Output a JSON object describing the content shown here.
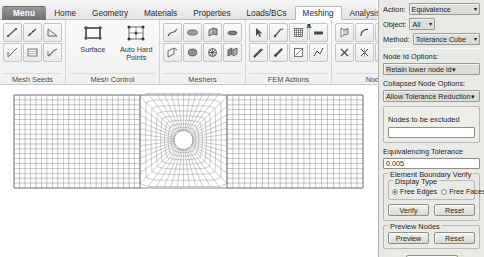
{
  "ribbon": {
    "tabs": [
      {
        "label": "Menu",
        "kind": "menu"
      },
      {
        "label": "Home",
        "kind": "normal"
      },
      {
        "label": "Geometry",
        "kind": "normal"
      },
      {
        "label": "Materials",
        "kind": "normal"
      },
      {
        "label": "Properties",
        "kind": "normal"
      },
      {
        "label": "Loads/BCs",
        "kind": "normal"
      },
      {
        "label": "Meshing",
        "kind": "active"
      },
      {
        "label": "Analysis",
        "kind": "normal"
      },
      {
        "label": "R",
        "kind": "normal"
      }
    ],
    "groups": [
      {
        "label": "Mesh Seeds",
        "icons": [
          "uniform-seed-icon",
          "one-way-bias-seed-icon",
          "two-way-bias-seed-icon",
          "curve-based-seed-icon",
          "tabular-seed-icon",
          "pcl-seed-icon"
        ]
      },
      {
        "label": "Mesh Control",
        "big": [
          {
            "label": "Surface",
            "icon": "surface-mesh-control-icon"
          },
          {
            "label": "Auto Hard Points",
            "icon": "auto-hard-points-icon"
          }
        ]
      },
      {
        "label": "Meshers",
        "icons": [
          "curve-mesher-icon",
          "surface-mesher-icon",
          "solid-mesher-icon",
          "sweep-mesher-icon",
          "edit-mesher-icon",
          "mesh-on-mesh-icon",
          "mesh-seed-edit-icon",
          "mesh-paver-icon"
        ]
      },
      {
        "label": "FEM Actions",
        "icons": [
          "pick-node-icon",
          "associate-icon",
          "equivalence-icon",
          "equivalence-all-icon",
          "renumber-icon",
          "verify-mesh-icon",
          "optimize-icon",
          "sweep-action-icon"
        ],
        "badge": "a"
      },
      {
        "label": "Node",
        "icons": [
          "create-node-icon",
          "arc-node-icon",
          "offset-node-icon",
          "project-node-icon",
          "delete-node-icon",
          "merge-node-icon",
          "edit-node-icon",
          "transform-node-icon"
        ]
      }
    ]
  },
  "viewport": {
    "model_name": "plate-with-hole-mesh",
    "mesh": {
      "type": "structured-quad",
      "plate": {
        "x0": 14,
        "y0": 10,
        "x1": 363,
        "y1": 103
      },
      "inner_block": {
        "x0": 140,
        "x1": 227
      },
      "hole": {
        "cx": 183.5,
        "cy": 55,
        "r": 9.2
      },
      "outer_cols_left": 23,
      "outer_cols_right": 23,
      "rows": 19,
      "radial_rings": 9,
      "circumferential_divisions": 48,
      "line_color": "#6f6f78",
      "background": "#ffffff"
    }
  },
  "panel": {
    "action": {
      "label": "Action:",
      "value": "Equivalence"
    },
    "object": {
      "label": "Object:",
      "value": "All"
    },
    "method": {
      "label": "Method:",
      "value": "Tolerance Cube"
    },
    "node_id_options": {
      "label": "Node Id Options:",
      "value": "Retain lower node id"
    },
    "collapsed_node_options": {
      "label": "Collapsed Node Options:",
      "value": "Allow Tolerance Reduction"
    },
    "nodes_excluded": {
      "title": "Nodes to be excluded",
      "value": "",
      "placeholder": ""
    },
    "tolerance": {
      "label": "Equivalencing Tolerance",
      "value": "0.005"
    },
    "element_boundary_verify": {
      "title": "Element Boundary Verify",
      "display_type": {
        "title": "Display Type",
        "options": [
          {
            "label": "Free Edges",
            "selected": true
          },
          {
            "label": "Free Faces",
            "selected": false
          }
        ]
      },
      "verify_label": "Verify",
      "reset_label": "Reset"
    },
    "preview_nodes": {
      "title": "Preview Nodes",
      "preview_label": "Preview",
      "reset_label": "Reset"
    },
    "apply_label": "-Apply-"
  }
}
